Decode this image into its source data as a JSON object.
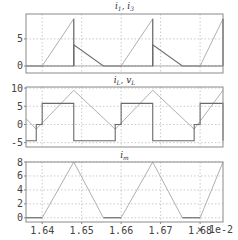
{
  "chart_data": [
    {
      "type": "line",
      "title": "i1, i3",
      "title_parts": {
        "main": "i",
        "sub1": "1",
        "sep": ", ",
        "main2": "i",
        "sub2": "3"
      },
      "xlabel": "",
      "ylabel": "",
      "xlim": [
        1.6359,
        1.6858
      ],
      "ylim": [
        -1.3,
        9.6
      ],
      "yticks": [
        0,
        5
      ],
      "ytick_labels": [
        "0",
        "5"
      ],
      "xticks": [
        1.64,
        1.65,
        1.66,
        1.67,
        1.68
      ],
      "grid": true,
      "series": [
        {
          "name": "i1",
          "style": "light",
          "x": [
            1.6359,
            1.64,
            1.648,
            1.648,
            1.66,
            1.668,
            1.668,
            1.68,
            1.688,
            1.688
          ],
          "y": [
            0,
            0,
            8.7,
            0,
            0,
            8.7,
            0,
            0,
            8.7,
            0
          ]
        },
        {
          "name": "i1-drop",
          "style": "dark",
          "x": [
            1.648,
            1.648,
            null,
            1.668,
            1.668,
            null,
            1.688,
            1.688
          ],
          "y": [
            8.7,
            0,
            null,
            8.7,
            0,
            null,
            8.7,
            0
          ]
        },
        {
          "name": "i3",
          "style": "dark",
          "x": [
            1.6359,
            1.64,
            1.648,
            1.648,
            1.6555,
            1.66,
            1.668,
            1.668,
            1.6755,
            1.68,
            1.6858
          ],
          "y": [
            0,
            0,
            0,
            3.9,
            0,
            0,
            0,
            3.9,
            0,
            0,
            0
          ]
        }
      ]
    },
    {
      "type": "line",
      "title": "iL, vL",
      "title_parts": {
        "main": "i",
        "sub1": "L",
        "sep": ", ",
        "main2": "v",
        "sub2": "L"
      },
      "xlabel": "",
      "ylabel": "",
      "xlim": [
        1.6359,
        1.6858
      ],
      "ylim": [
        -6.2,
        10.3
      ],
      "yticks": [
        -5,
        0,
        5,
        10
      ],
      "ytick_labels": [
        "-5",
        "0",
        "5",
        "10"
      ],
      "xticks": [
        1.64,
        1.65,
        1.66,
        1.67,
        1.68
      ],
      "grid": true,
      "series": [
        {
          "name": "iL",
          "style": "light",
          "x": [
            1.6359,
            1.6385,
            1.648,
            1.6585,
            1.668,
            1.6785,
            1.688
          ],
          "y": [
            1.6,
            -1.3,
            9.4,
            -1.3,
            9.4,
            -1.3,
            9.4
          ]
        },
        {
          "name": "vL",
          "style": "dark",
          "x": [
            1.6359,
            1.6385,
            1.6385,
            1.64,
            1.64,
            1.648,
            1.648,
            1.6585,
            1.6585,
            1.66,
            1.66,
            1.668,
            1.668,
            1.6785,
            1.6785,
            1.68,
            1.68,
            1.688,
            1.688,
            1.6858
          ],
          "y": [
            -4.5,
            -4.5,
            0,
            0,
            5.8,
            5.8,
            -4.5,
            -4.5,
            0,
            0,
            5.8,
            5.8,
            -4.5,
            -4.5,
            0,
            0,
            5.8,
            5.8,
            -4.5,
            -4.5
          ]
        }
      ]
    },
    {
      "type": "line",
      "title": "im",
      "title_parts": {
        "main": "i",
        "sub1": "m"
      },
      "xlabel": "× 1e-2",
      "ylabel": "",
      "xlim": [
        1.6359,
        1.6858
      ],
      "ylim": [
        -0.6,
        8.0
      ],
      "yticks": [
        0,
        2,
        4,
        6,
        8
      ],
      "ytick_labels": [
        "0",
        "2",
        "4",
        "6",
        "8"
      ],
      "xticks": [
        1.64,
        1.65,
        1.66,
        1.67,
        1.68
      ],
      "xtick_labels": [
        "1.64",
        "1.65",
        "1.66",
        "1.67",
        "1.68"
      ],
      "grid": true,
      "series": [
        {
          "name": "im",
          "style": "light",
          "x": [
            1.6359,
            1.64,
            1.648,
            1.6555,
            1.66,
            1.668,
            1.6755,
            1.68,
            1.688
          ],
          "y": [
            0,
            0,
            8,
            0,
            0,
            8,
            0,
            0,
            8
          ]
        },
        {
          "name": "im-base",
          "style": "dark",
          "x": [
            1.6359,
            1.64,
            null,
            1.6555,
            1.66,
            null,
            1.6755,
            1.68
          ],
          "y": [
            0,
            0,
            null,
            0,
            0,
            null,
            0,
            0
          ]
        }
      ]
    }
  ],
  "axis": {
    "x_multiplier_label": "× 1e-2",
    "xtick_labels": [
      "1.64",
      "1.65",
      "1.66",
      "1.67",
      "1.68"
    ]
  },
  "titles": {
    "plot1": {
      "a": "i",
      "a_sub": "1",
      "sep": ", ",
      "b": "i",
      "b_sub": "3"
    },
    "plot2": {
      "a": "i",
      "a_sub": "L",
      "sep": ", ",
      "b": "v",
      "b_sub": "L"
    },
    "plot3": {
      "a": "i",
      "a_sub": "m"
    }
  }
}
